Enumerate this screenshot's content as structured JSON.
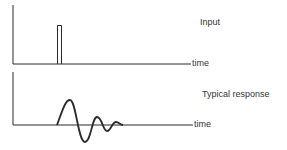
{
  "panels": [
    {
      "label": "Input",
      "axis_label": "time"
    },
    {
      "label": "Typical response",
      "axis_label": "time"
    }
  ],
  "colors": {
    "stroke": "#2a2a2a",
    "background": "#ffffff"
  }
}
